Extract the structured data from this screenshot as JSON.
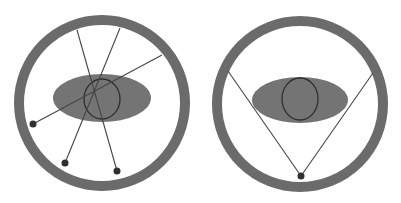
{
  "colors": {
    "ring": "#6b6b6b",
    "ellipse": "#747474",
    "circle_stroke": "#2e2e2e",
    "line": "#454545",
    "dot": "#303030",
    "background": "#ffffff"
  },
  "diagrams": [
    {
      "name": "multiple-sources",
      "ring": {
        "cx": 102,
        "cy": 103,
        "r": 83,
        "stroke_width": 10
      },
      "ellipse": {
        "cx": 102,
        "cy": 98,
        "rx": 49,
        "ry": 24
      },
      "circle": {
        "cx": 102,
        "cy": 99,
        "rx": 18,
        "ry": 20
      },
      "rays": [
        {
          "x1": 33,
          "y1": 124,
          "x2": 162,
          "y2": 55
        },
        {
          "x1": 65,
          "y1": 163,
          "x2": 120,
          "y2": 28
        },
        {
          "x1": 117,
          "y1": 171,
          "x2": 77,
          "y2": 30
        }
      ],
      "dots": [
        {
          "cx": 33,
          "cy": 124,
          "r": 3.5
        },
        {
          "cx": 65,
          "cy": 163,
          "r": 3.5
        },
        {
          "cx": 117,
          "cy": 171,
          "r": 3.5
        }
      ]
    },
    {
      "name": "single-source",
      "ring": {
        "cx": 300,
        "cy": 104,
        "r": 83,
        "stroke_width": 10
      },
      "ellipse": {
        "cx": 300,
        "cy": 100,
        "rx": 48,
        "ry": 23
      },
      "circle": {
        "cx": 300,
        "cy": 99,
        "rx": 18,
        "ry": 21
      },
      "rays": [
        {
          "x1": 301,
          "y1": 176,
          "x2": 228,
          "y2": 71
        },
        {
          "x1": 301,
          "y1": 176,
          "x2": 373,
          "y2": 73
        }
      ],
      "dots": [
        {
          "cx": 301,
          "cy": 176,
          "r": 3.5
        }
      ]
    }
  ]
}
